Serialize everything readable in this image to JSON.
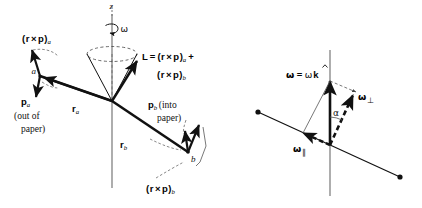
{
  "figure": {
    "background_color": "#ffffff",
    "ink_color": "#111111",
    "panels": [
      {
        "id": "left-panel",
        "name": "angular-momentum-dumbbell-diagram",
        "description": "Rotating dumbbell of two masses a and b on a rigid rod through the origin, precessing about the vertical z axis"
      },
      {
        "id": "right-panel",
        "name": "angular-velocity-decomposition-diagram",
        "description": "Angular velocity vector omega along k decomposed into parallel and perpendicular components relative to the rod"
      }
    ]
  },
  "left_panel": {
    "axis_label_z": "z",
    "omega_label": "ω",
    "mass_a_label": "a",
    "mass_b_label": "b",
    "cross_a_label_open": "(",
    "cross_a_label_r": "r",
    "cross_a_label_times": "×",
    "cross_a_label_p": "p",
    "cross_a_label_close": ")",
    "cross_a_sub": "a",
    "cross_b_sub": "b",
    "p_a_symbol": "p",
    "p_a_sub": "a",
    "p_a_note_line1": "(out of",
    "p_a_note_line2": "paper)",
    "p_b_symbol": "p",
    "p_b_sub": "b",
    "p_b_note_line1": "(into",
    "p_b_note_line2": "paper)",
    "r_a_symbol": "r",
    "r_a_sub": "a",
    "r_b_symbol": "r",
    "r_b_sub": "b",
    "L_symbol": "L",
    "L_equals": "=",
    "L_plus": "+"
  },
  "right_panel": {
    "omega_symbol": "ω",
    "omega_equals": "=",
    "omega_magnitude": "ω",
    "k_hat": "k",
    "omega_perp_symbol": "ω",
    "omega_perp_sub": "⊥",
    "omega_par_symbol": "ω",
    "omega_par_sub": "∥",
    "angle_label": "α"
  }
}
